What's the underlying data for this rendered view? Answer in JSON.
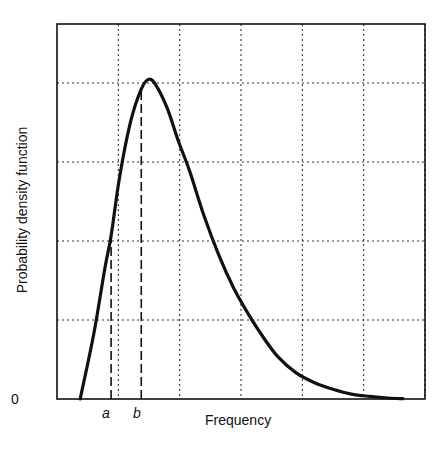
{
  "chart_data": {
    "type": "line",
    "title": "",
    "xlabel": "Frequency",
    "ylabel": "Probability density function",
    "y_tick_labels": [
      "0"
    ],
    "x_tick_labels": [
      {
        "label": "a",
        "position": 0.147
      },
      {
        "label": "b",
        "position": 0.229
      }
    ],
    "grid": true,
    "grid_style": "dotted",
    "x_gridlines": 6,
    "y_gridlines": 5,
    "xlim": [
      0,
      1
    ],
    "ylim": [
      0,
      1
    ],
    "series": [
      {
        "name": "PDF (right-skewed, log-normal-like)",
        "x": [
          0.063,
          0.1,
          0.13,
          0.147,
          0.17,
          0.2,
          0.229,
          0.25,
          0.27,
          0.3,
          0.33,
          0.36,
          0.4,
          0.44,
          0.48,
          0.52,
          0.56,
          0.6,
          0.65,
          0.7,
          0.75,
          0.8,
          0.85,
          0.9,
          0.94
        ],
        "y": [
          0.0,
          0.2,
          0.4,
          0.5,
          0.68,
          0.85,
          0.95,
          0.98,
          0.96,
          0.89,
          0.79,
          0.7,
          0.56,
          0.44,
          0.34,
          0.26,
          0.19,
          0.13,
          0.08,
          0.05,
          0.03,
          0.015,
          0.008,
          0.003,
          0.001
        ]
      }
    ],
    "annotations": [
      {
        "type": "vertical_dashed_line",
        "x": 0.147,
        "label": "a",
        "y_top": 0.5
      },
      {
        "type": "vertical_dashed_line",
        "x": 0.229,
        "label": "b",
        "y_top": 0.95
      }
    ]
  },
  "labels": {
    "xlabel": "Frequency",
    "ylabel": "Probability density function",
    "zero": "0",
    "a": "a",
    "b": "b"
  }
}
